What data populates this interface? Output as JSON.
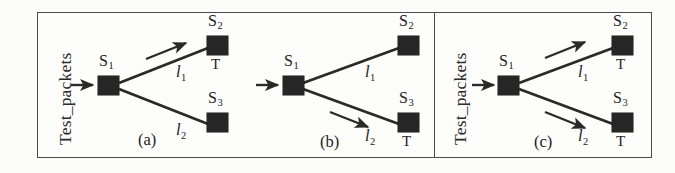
{
  "figure": {
    "caption_vertical": "Test_packets",
    "node_labels": {
      "s1": "S",
      "s2": "S",
      "s3": "S"
    },
    "sub_1": "1",
    "sub_2": "2",
    "sub_3": "3",
    "link_label_l": "l",
    "terminal_label": "T",
    "colors": {
      "node_fill": "#262626",
      "frame_stroke": "#4b4b4b",
      "edge_stroke": "#2a2a2a",
      "background": "#fdfdfc",
      "text": "#232323"
    }
  },
  "panels": [
    {
      "id": "a",
      "caption": "(a)",
      "has_test_packets_caption": true,
      "source_node": "S1",
      "sink_nodes": [
        "S2",
        "S3"
      ],
      "links": [
        {
          "name": "l1",
          "label": "l",
          "sub": "1",
          "from": "S1",
          "to": "S2",
          "traversed": true
        },
        {
          "name": "l2",
          "label": "l",
          "sub": "2",
          "from": "S1",
          "to": "S3",
          "traversed": false
        }
      ],
      "terminals": [
        "S2"
      ]
    },
    {
      "id": "b",
      "caption": "(b)",
      "has_test_packets_caption": false,
      "source_node": "S1",
      "sink_nodes": [
        "S2",
        "S3"
      ],
      "links": [
        {
          "name": "l1",
          "label": "l",
          "sub": "1",
          "from": "S1",
          "to": "S2",
          "traversed": false
        },
        {
          "name": "l2",
          "label": "l",
          "sub": "2",
          "from": "S1",
          "to": "S3",
          "traversed": true
        }
      ],
      "terminals": [
        "S3"
      ]
    },
    {
      "id": "c",
      "caption": "(c)",
      "has_test_packets_caption": true,
      "source_node": "S1",
      "sink_nodes": [
        "S2",
        "S3"
      ],
      "links": [
        {
          "name": "l1",
          "label": "l",
          "sub": "1",
          "from": "S1",
          "to": "S2",
          "traversed": true
        },
        {
          "name": "l2",
          "label": "l",
          "sub": "2",
          "from": "S1",
          "to": "S3",
          "traversed": true
        }
      ],
      "terminals": [
        "S2",
        "S3"
      ]
    }
  ]
}
